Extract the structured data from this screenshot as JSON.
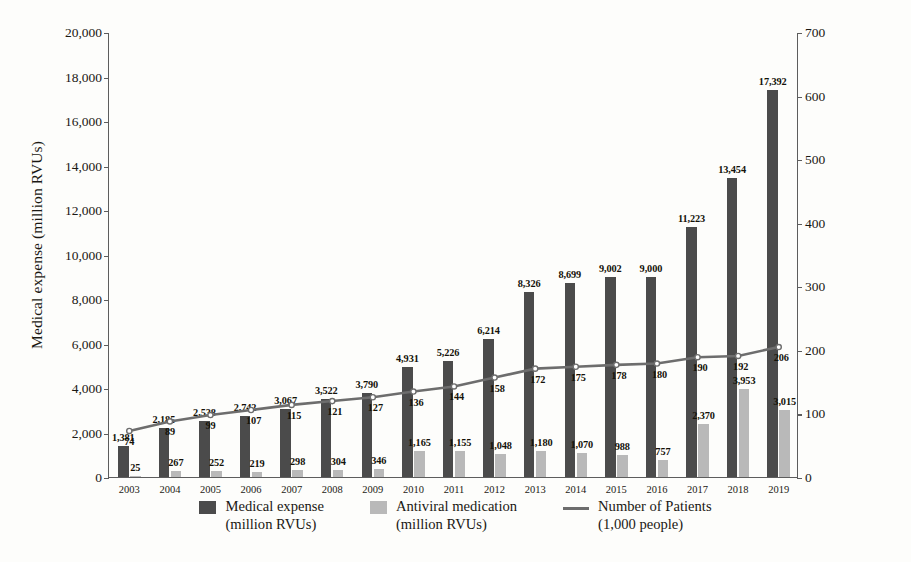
{
  "chart_data": {
    "type": "bar",
    "title": "",
    "xlabel": "",
    "ylabel": "Medical expense (million RVUs)",
    "y2label": "Patient seeking medical care(1,000 people)",
    "ylim": [
      0,
      20000
    ],
    "y2lim": [
      0,
      700
    ],
    "yticks": [
      "0",
      "2,000",
      "4,000",
      "6,000",
      "8,000",
      "10,000",
      "12,000",
      "14,000",
      "16,000",
      "18,000",
      "20,000"
    ],
    "y2ticks": [
      "0",
      "100",
      "200",
      "300",
      "400",
      "500",
      "600",
      "700"
    ],
    "grid": false,
    "legend_position": "bottom",
    "categories": [
      "2003",
      "2004",
      "2005",
      "2006",
      "2007",
      "2008",
      "2009",
      "2010",
      "2011",
      "2012",
      "2013",
      "2014",
      "2015",
      "2016",
      "2017",
      "2018",
      "2019"
    ],
    "series": [
      {
        "name": "Medical expense\n(million RVUs)",
        "name_line1": "Medical expense",
        "name_line2": "(million RVUs)",
        "type": "bar",
        "axis": "left",
        "color": "#4b4b4b",
        "values": [
          1381,
          2185,
          2538,
          2742,
          3067,
          3522,
          3790,
          4931,
          5226,
          6214,
          8326,
          8699,
          9002,
          9000,
          11223,
          13454,
          17392
        ],
        "labels": [
          "1,381",
          "2,185",
          "2,538",
          "2,742",
          "3,067",
          "3,522",
          "3,790",
          "4,931",
          "5,226",
          "6,214",
          "8,326",
          "8,699",
          "9,002",
          "9,000",
          "11,223",
          "13,454",
          "17,392"
        ]
      },
      {
        "name": "Antiviral medication\n(million RVUs)",
        "name_line1": "Antiviral medication",
        "name_line2": "(million RVUs)",
        "type": "bar",
        "axis": "left",
        "color": "#b9b9b9",
        "values": [
          25,
          267,
          252,
          219,
          298,
          304,
          346,
          1165,
          1155,
          1048,
          1180,
          1070,
          988,
          757,
          2370,
          3953,
          3015
        ],
        "labels": [
          "25",
          "267",
          "252",
          "219",
          "298",
          "304",
          "346",
          "1,165",
          "1,155",
          "1,048",
          "1,180",
          "1,070",
          "988",
          "757",
          "2,370",
          "3,953",
          "3,015"
        ]
      },
      {
        "name": "Number of Patients\n(1,000 people)",
        "name_line1": "Number of Patients",
        "name_line2": "(1,000 people)",
        "type": "line",
        "axis": "right",
        "color": "#6d6d6d",
        "values": [
          74,
          89,
          99,
          107,
          115,
          121,
          127,
          136,
          144,
          158,
          172,
          175,
          178,
          180,
          190,
          192,
          206
        ],
        "labels": [
          "74",
          "89",
          "99",
          "107",
          "115",
          "121",
          "127",
          "136",
          "144",
          "158",
          "172",
          "175",
          "178",
          "180",
          "190",
          "192",
          "206"
        ]
      }
    ]
  },
  "legend": {
    "items": [
      {
        "marker": "dark-square",
        "line1": "Medical expense",
        "line2": "(million RVUs)"
      },
      {
        "marker": "light-square",
        "line1": "Antiviral medication",
        "line2": "(million RVUs)"
      },
      {
        "marker": "line",
        "line1": "Number of Patients",
        "line2": "(1,000 people)"
      }
    ]
  }
}
